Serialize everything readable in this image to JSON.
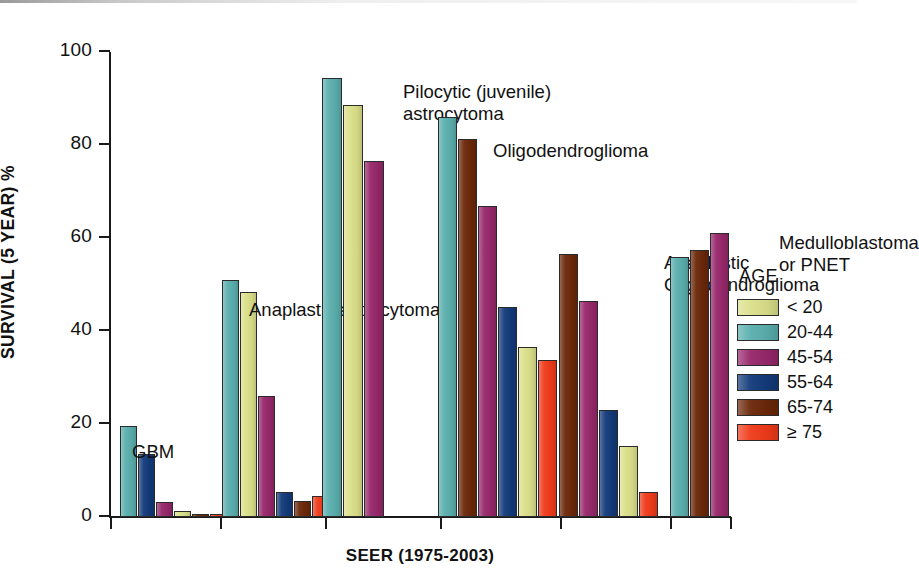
{
  "chart_data": {
    "type": "bar",
    "title": "",
    "xlabel": "SEER (1975-2003)",
    "ylabel": "SURVIVAL (5 YEAR) %",
    "ylim": [
      0,
      100
    ],
    "yticks": [
      0,
      20,
      40,
      60,
      80,
      100
    ],
    "grid": false,
    "legend_title": "AGE",
    "legend_position": "right",
    "series": [
      {
        "name": "< 20",
        "color": "#dbe08a"
      },
      {
        "name": "20-44",
        "color": "#5aafae"
      },
      {
        "name": "45-54",
        "color": "#97276b"
      },
      {
        "name": "55-64",
        "color": "#123a7a"
      },
      {
        "name": "65-74",
        "color": "#6b2708"
      },
      {
        "name": "≥ 75",
        "color": "#f03a1a"
      }
    ],
    "categories": [
      "GBM",
      "Anaplastic astrocytoma",
      "Pilocytic (juvenile) astrocytoma",
      "Oligodendroglioma",
      "Anaplastic Oligodendroglioma",
      "Medulloblastoma or PNET"
    ],
    "groups": [
      {
        "category": "GBM",
        "label_lines": [
          "GBM"
        ],
        "bars": [
          {
            "series": "20-44",
            "value": 19.5,
            "color": "#5aafae"
          },
          {
            "series": "55-64",
            "value": 13.5,
            "color": "#123a7a"
          },
          {
            "series": "45-54",
            "value": 3.3,
            "color": "#97276b"
          },
          {
            "series": "< 20",
            "value": 1.3,
            "color": "#dbe08a"
          },
          {
            "series": "65-74",
            "value": 0.7,
            "color": "#6b2708"
          },
          {
            "series": "≥ 75",
            "value": 0.7,
            "color": "#f03a1a"
          }
        ]
      },
      {
        "category": "Anaplastic astrocytoma",
        "label_lines": [
          "Anaplastic astrocytoma"
        ],
        "bars": [
          {
            "series": "20-44",
            "value": 51.0,
            "color": "#5aafae"
          },
          {
            "series": "< 20",
            "value": 48.3,
            "color": "#dbe08a"
          },
          {
            "series": "45-54",
            "value": 26.0,
            "color": "#97276b"
          },
          {
            "series": "55-64",
            "value": 5.3,
            "color": "#123a7a"
          },
          {
            "series": "65-74",
            "value": 3.5,
            "color": "#6b2708"
          },
          {
            "series": "≥ 75",
            "value": 4.5,
            "color": "#f03a1a"
          }
        ]
      },
      {
        "category": "Pilocytic (juvenile) astrocytoma",
        "label_lines": [
          "Pilocytic (juvenile)",
          "astrocytoma"
        ],
        "bars": [
          {
            "series": "20-44",
            "value": 94.5,
            "color": "#5aafae"
          },
          {
            "series": "< 20",
            "value": 88.5,
            "color": "#dbe08a"
          },
          {
            "series": "45-54",
            "value": 76.5,
            "color": "#97276b"
          }
        ]
      },
      {
        "category": "Oligodendroglioma",
        "label_lines": [
          "Oligodendroglioma"
        ],
        "bars": [
          {
            "series": "20-44",
            "value": 86.0,
            "color": "#5aafae"
          },
          {
            "series": "65-74",
            "value": 81.2,
            "color": "#6b2708"
          },
          {
            "series": "45-54",
            "value": 66.8,
            "color": "#97276b"
          },
          {
            "series": "55-64",
            "value": 45.2,
            "color": "#123a7a"
          },
          {
            "series": "< 20",
            "value": 36.5,
            "color": "#dbe08a"
          },
          {
            "series": "≥ 75",
            "value": 33.8,
            "color": "#f03a1a"
          }
        ]
      },
      {
        "category": "Anaplastic Oligodendroglioma",
        "label_lines": [
          "Anaplastic",
          "Oligodendroglioma"
        ],
        "bars": [
          {
            "series": "65-74",
            "value": 56.5,
            "color": "#6b2708"
          },
          {
            "series": "45-54",
            "value": 46.5,
            "color": "#97276b"
          },
          {
            "series": "55-64",
            "value": 23.0,
            "color": "#123a7a"
          },
          {
            "series": "< 20",
            "value": 15.2,
            "color": "#dbe08a"
          },
          {
            "series": "≥ 75",
            "value": 5.3,
            "color": "#f03a1a"
          }
        ]
      },
      {
        "category": "Medulloblastoma or PNET",
        "label_lines": [
          "Medulloblastoma",
          "or PNET"
        ],
        "bars": [
          {
            "series": "20-44",
            "value": 56.0,
            "color": "#5aafae"
          },
          {
            "series": "65-74",
            "value": 57.5,
            "color": "#6b2708"
          },
          {
            "series": "45-54",
            "value": 61.0,
            "color": "#97276b"
          }
        ]
      }
    ]
  },
  "layout": {
    "group_slots": [
      {
        "left": 10,
        "bar_width": 17,
        "gap": 1
      },
      {
        "left": 112,
        "bar_width": 17,
        "gap": 1
      },
      {
        "left": 212,
        "bar_width": 20,
        "gap": 1
      },
      {
        "left": 328,
        "bar_width": 19,
        "gap": 1
      },
      {
        "left": 449,
        "bar_width": 19,
        "gap": 1
      },
      {
        "left": 560,
        "bar_width": 19,
        "gap": 1
      }
    ],
    "xticks": [
      0,
      110,
      215,
      330,
      450,
      560,
      620
    ],
    "annotations": [
      {
        "left": 22,
        "top": 389,
        "align": "left"
      },
      {
        "left": 139,
        "top": 247,
        "align": "left"
      },
      {
        "left": 293,
        "top": 29,
        "align": "left"
      },
      {
        "left": 383,
        "top": 88,
        "align": "left"
      },
      {
        "left": 554,
        "top": 200,
        "align": "left"
      },
      {
        "left": 669,
        "top": 180,
        "align": "left"
      }
    ]
  }
}
